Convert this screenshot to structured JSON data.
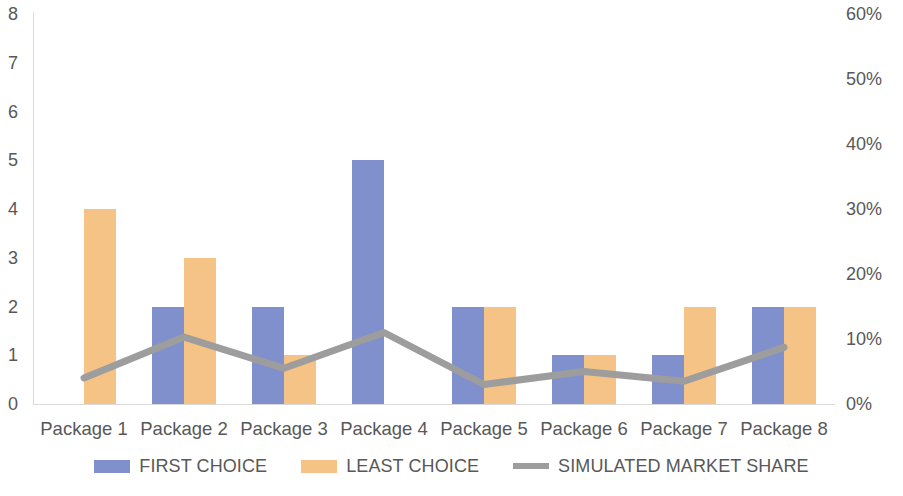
{
  "chart_data": {
    "type": "bar",
    "title": "",
    "subtitle": "",
    "xlabel": "",
    "ylabel": "",
    "categories": [
      "Package 1",
      "Package 2",
      "Package 3",
      "Package 4",
      "Package 5",
      "Package 6",
      "Package 7",
      "Package 8"
    ],
    "series": [
      {
        "name": "FIRST CHOICE",
        "type": "bar",
        "axis": "left",
        "color": "#8090cc",
        "values": [
          0,
          2,
          2,
          5,
          2,
          1,
          1,
          2
        ]
      },
      {
        "name": "LEAST CHOICE",
        "type": "bar",
        "axis": "left",
        "color": "#f6c386",
        "values": [
          4,
          3,
          1,
          0,
          2,
          1,
          2,
          2
        ]
      },
      {
        "name": "SIMULATED MARKET SHARE",
        "type": "line",
        "axis": "right",
        "color": "#9d9d9d",
        "values": [
          4,
          10.3,
          5.5,
          11,
          3,
          5,
          3.5,
          8.7
        ],
        "value_labels": [
          "4%",
          "10%",
          "6%",
          "11%",
          "3%",
          "5%",
          "4%",
          "9%"
        ]
      }
    ],
    "y_left": {
      "min": 0,
      "max": 8,
      "step": 1,
      "ticks": [
        "0",
        "1",
        "2",
        "3",
        "4",
        "5",
        "6",
        "7",
        "8"
      ]
    },
    "y_right": {
      "min": 0,
      "max": 60,
      "step": 10,
      "ticks": [
        "0%",
        "10%",
        "20%",
        "30%",
        "40%",
        "50%",
        "60%"
      ]
    },
    "grid": false,
    "legend_position": "bottom",
    "legend": [
      {
        "label": "FIRST CHOICE",
        "marker": "square",
        "color": "#8090cc"
      },
      {
        "label": "LEAST CHOICE",
        "marker": "square",
        "color": "#f6c386"
      },
      {
        "label": "SIMULATED MARKET SHARE",
        "marker": "line",
        "color": "#9d9d9d"
      }
    ]
  },
  "colors": {
    "first_choice": "#8090cc",
    "least_choice": "#f6c386",
    "market_share_line": "#9d9d9d",
    "axis": "#d9d9d9",
    "text": "#585858",
    "background": "#ffffff"
  }
}
